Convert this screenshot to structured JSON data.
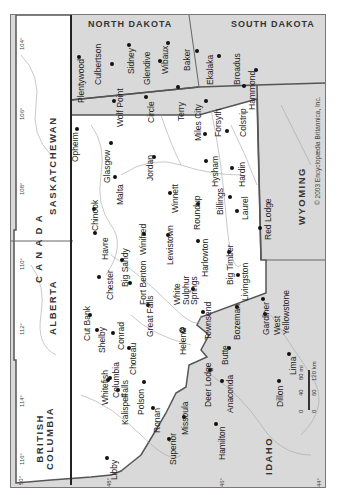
{
  "page_header": "Montana 349",
  "map": {
    "title": "Montana",
    "orientation": "rotated 90° (north to the left)",
    "copyright": "© 2003 Encyclopædia Britannica, Inc.",
    "colors": {
      "state_fill": "#ffffff",
      "neighbor_fill": "#d9d9d9",
      "border": "#555555",
      "river": "#9a9a9a",
      "text": "#222222"
    },
    "regions": [
      {
        "id": "north-dakota",
        "label": "NORTH DAKOTA"
      },
      {
        "id": "south-dakota",
        "label": "SOUTH DAKOTA"
      },
      {
        "id": "wyoming",
        "label": "WYOMING"
      },
      {
        "id": "idaho",
        "label": "IDAHO"
      },
      {
        "id": "saskatchewan",
        "label": "SASKATCHEWAN"
      },
      {
        "id": "alberta",
        "label": "ALBERTA"
      },
      {
        "id": "british-columbia",
        "label": "BRITISH\nCOLUMBIA"
      },
      {
        "id": "canada",
        "label": "C A N A D A"
      }
    ],
    "meridians": [
      "104°",
      "106°",
      "108°",
      "110°",
      "112°",
      "114°",
      "116°"
    ],
    "parallels": [
      "50°",
      "48°",
      "46°",
      "44°"
    ],
    "scale_bar": {
      "miles": [
        "0",
        "40",
        "80 mi"
      ],
      "km": [
        "0",
        "60",
        "120 km"
      ]
    },
    "capital": "Helena",
    "cities": [
      "Plentywood",
      "Culbertson",
      "Sidney",
      "Glendive",
      "Wibaux",
      "Baker",
      "Ekalaka",
      "Broadus",
      "Hammond",
      "Wolf Point",
      "Circle",
      "Terry",
      "Miles City",
      "Forsyth",
      "Colstrip",
      "Opheim",
      "Glasgow",
      "Jordan",
      "Malta",
      "Hysham",
      "Hardin",
      "Chinook",
      "Winnett",
      "Roundup",
      "Billings",
      "Laurel",
      "Red Lodge",
      "Winifred",
      "Lewistown",
      "Havre",
      "Big Sandy",
      "Harlowton",
      "Big Timber",
      "Chester",
      "Fort Benton",
      "White Sulphur Springs",
      "Livingston",
      "Cut Bank",
      "Shelby",
      "Conrad",
      "Great Falls",
      "Townsend",
      "Bozeman",
      "Gardiner",
      "West Yellowstone",
      "Choteau",
      "Helena",
      "Butte",
      "Lima",
      "Dillon",
      "Whitefish",
      "Columbia Falls",
      "Kalispell",
      "Polson",
      "Ronan",
      "Missoula",
      "Deer Lodge",
      "Anaconda",
      "Superior",
      "Hamilton",
      "Libby"
    ]
  }
}
